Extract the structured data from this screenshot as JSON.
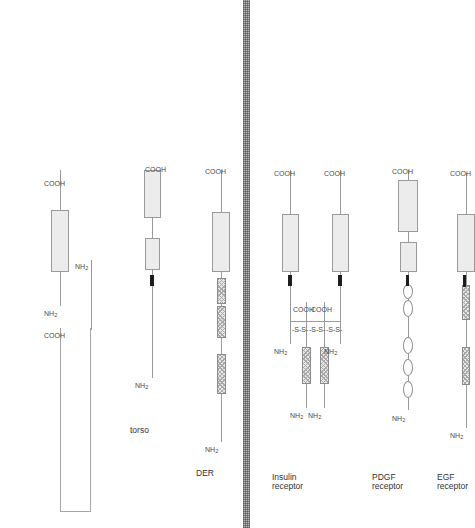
{
  "figure": {
    "membrane_label": "plasma-membrane",
    "colors": {
      "line": "#9a9a9a",
      "kinase_fill": "#ececec",
      "cysteine_rich_fill": "#e7e7e7",
      "transmembrane": "#1d1d1d",
      "membrane_bar": "#8f8f8f",
      "background": "#ffffff"
    },
    "terminus_labels": {
      "n_term": "NH",
      "n_term_sub": "2",
      "c_term": "COOH"
    },
    "disulfide_label": "-S-S-"
  },
  "receptors": [
    {
      "id": "egf-receptor",
      "name": "EGF\nreceptor",
      "name_line1": "EGF",
      "name_line2": "receptor",
      "n_terminus": "NH",
      "n_terminus_sub": "2",
      "c_terminus": "COOH",
      "cysteine_rich_regions": 2,
      "ig_loops": 0,
      "kinase_domains": 1,
      "kinase_split": false,
      "chains": 1,
      "disulfide_bonds": 0
    },
    {
      "id": "pdgf-receptor",
      "name": "PDGF\nreceptor",
      "name_line1": "PDGF",
      "name_line2": "receptor",
      "n_terminus": "NH",
      "n_terminus_sub": "2",
      "c_terminus": "COOH",
      "cysteine_rich_regions": 0,
      "ig_loops": 5,
      "kinase_domains": 2,
      "kinase_split": true,
      "chains": 1,
      "disulfide_bonds": 0
    },
    {
      "id": "insulin-receptor",
      "name": "Insulin\nreceptor",
      "name_line1": "Insulin",
      "name_line2": "receptor",
      "n_terminus": "NH",
      "n_terminus_sub": "2",
      "c_terminus": "COOH",
      "cysteine_rich_regions": 2,
      "ig_loops": 0,
      "kinase_domains": 2,
      "kinase_split": false,
      "chains": 4,
      "chain_names": [
        "alpha",
        "alpha",
        "beta",
        "beta"
      ],
      "disulfide_bonds": 3,
      "disulfide_label": "-S-S-"
    },
    {
      "id": "der",
      "name": "DER",
      "name_line1": "DER",
      "name_line2": "",
      "n_terminus": "NH",
      "n_terminus_sub": "2",
      "c_terminus": "COOH",
      "cysteine_rich_regions": 3,
      "ig_loops": 0,
      "kinase_domains": 1,
      "kinase_split": false,
      "chains": 1,
      "disulfide_bonds": 0
    },
    {
      "id": "torso",
      "name": "torso",
      "name_line1": "torso",
      "name_line2": "",
      "n_terminus": "NH",
      "n_terminus_sub": "2",
      "c_terminus": "COOH",
      "cysteine_rich_regions": 0,
      "ig_loops": 0,
      "kinase_domains": 2,
      "kinase_split": true,
      "chains": 1,
      "disulfide_bonds": 0
    },
    {
      "id": "sevenless",
      "name": "",
      "name_line1": "",
      "name_line2": "",
      "n_terminus": "NH",
      "n_terminus_sub": "2",
      "c_terminus": "COOH",
      "cysteine_rich_regions": 0,
      "ig_loops": 0,
      "kinase_domains": 1,
      "kinase_split": false,
      "chains": 2,
      "has_hairpin_loop": true,
      "disulfide_bonds": 0
    }
  ]
}
